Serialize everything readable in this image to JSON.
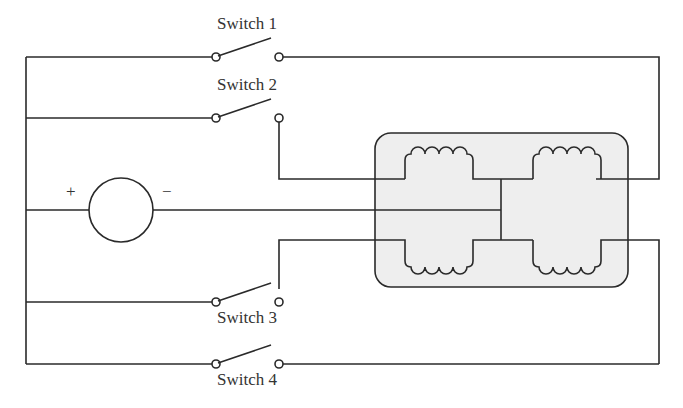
{
  "diagram": {
    "type": "circuit-schematic",
    "source": {
      "plus_label": "+",
      "minus_label": "−"
    },
    "switches": [
      {
        "label": "Switch 1"
      },
      {
        "label": "Switch 2"
      },
      {
        "label": "Switch 3"
      },
      {
        "label": "Switch 4"
      }
    ],
    "motor_box_color": "#eeeeee",
    "wire_color": "#2a2a2a"
  }
}
